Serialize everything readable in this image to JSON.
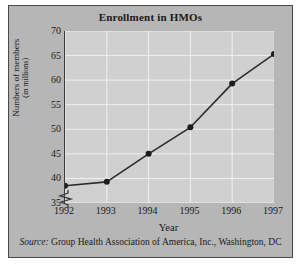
{
  "figure": {
    "title": "Enrollment in HMOs",
    "source_label": "Source:",
    "source_text": " Group Health Association of America, Inc., Washington, DC"
  },
  "colors": {
    "panel_background": "#b6b6b6",
    "plot_background": "#d0d0d0",
    "gridline": "#f0f0f0",
    "axis": "#3a3a3a",
    "series_line": "#2b2b2b",
    "marker": "#1c1c1c",
    "text": "#1a1a1a"
  },
  "chart_data": {
    "type": "line",
    "title": "Enrollment in HMOs",
    "xlabel": "Year",
    "ylabel": "Numbers of members (in millions)",
    "ylabel_line1": "Numbers of members",
    "ylabel_line2": "(in millions)",
    "categories": [
      "1992",
      "1993",
      "1994",
      "1995",
      "1996",
      "1997"
    ],
    "x": [
      1992,
      1993,
      1994,
      1995,
      1996,
      1997
    ],
    "values": [
      38.5,
      39.3,
      45.0,
      50.4,
      59.3,
      65.3
    ],
    "series": [
      {
        "name": "Numbers of members (in millions)",
        "values": [
          38.5,
          39.3,
          45.0,
          50.4,
          59.3,
          65.3
        ]
      }
    ],
    "yticks": [
      35,
      40,
      45,
      50,
      55,
      60,
      65,
      70
    ],
    "ylim": [
      35,
      70
    ],
    "xlim": [
      1992,
      1997
    ],
    "y_axis_break": true,
    "y_axis_break_note": "zigzag break below 35",
    "grid": true,
    "grid_axis": "both",
    "legend": "none",
    "marker": "filled-circle"
  }
}
